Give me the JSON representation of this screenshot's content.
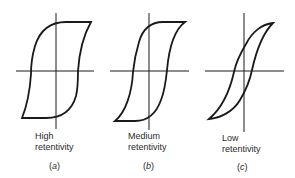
{
  "figure": {
    "line_color": "#1a1a1a",
    "panels": [
      {
        "id": "a",
        "caption_line1": "High",
        "caption_line2": "retentivity",
        "letter": "a",
        "label": "(a)"
      },
      {
        "id": "b",
        "caption_line1": "Medium",
        "caption_line2": "retentivity",
        "letter": "b",
        "label": "(b)"
      },
      {
        "id": "c",
        "caption_line1": "Low",
        "caption_line2": "retentivity",
        "letter": "c",
        "label": "(c)"
      }
    ],
    "paren_open": "(",
    "paren_close": ")"
  }
}
